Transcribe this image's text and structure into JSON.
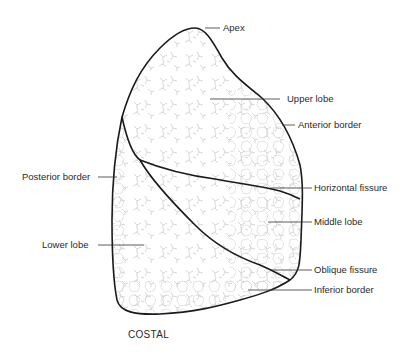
{
  "diagram": {
    "view_caption": "COSTAL",
    "labels": {
      "apex": "Apex",
      "upper_lobe": "Upper lobe",
      "anterior_border": "Anterior border",
      "horizontal_fissure": "Horizontal fissure",
      "middle_lobe": "Middle lobe",
      "oblique_fissure": "Oblique fissure",
      "inferior_border": "Inferior border",
      "posterior_border": "Posterior border",
      "lower_lobe": "Lower lobe"
    },
    "colors": {
      "outline": "#1a1a1a",
      "texture": "#c8c8c8",
      "leader_line": "#333333",
      "text": "#2a2a2a"
    }
  }
}
